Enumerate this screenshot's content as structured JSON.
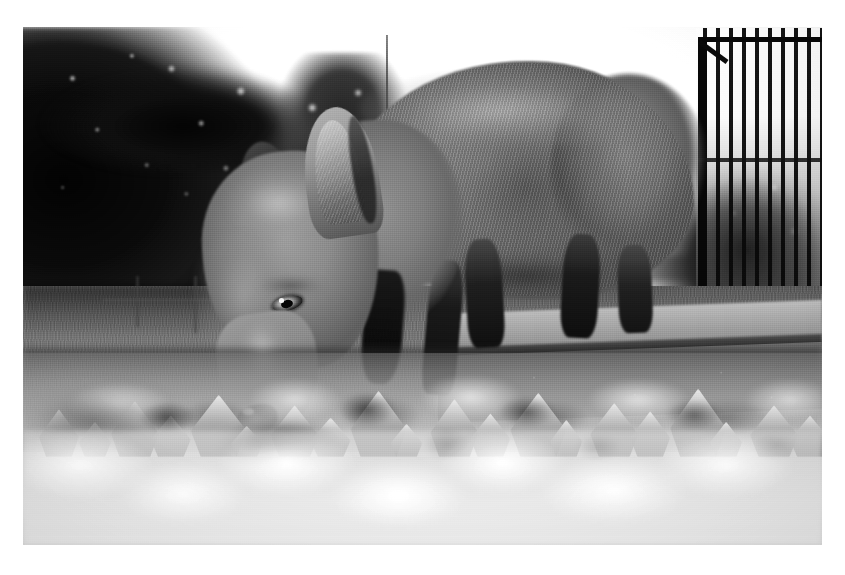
{
  "page": {
    "background_color": "#ffffff",
    "width": 845,
    "height": 575
  },
  "photo": {
    "alt": "Black and white photograph of a red fox foraging head-down among fallen leaves",
    "frame": {
      "x": 23,
      "y": 27,
      "width": 799,
      "height": 518
    },
    "color_mode": "grayscale",
    "palette": {
      "sky": "#fbfbfb",
      "tree_mass": "#101010",
      "grass": "#7d7d7d",
      "fox_fur": "#8a8a8a",
      "fox_legs": "#1a1a1a",
      "stone_kerb": "#6e6e6e",
      "leaf_litter_highlight": "#ffffff",
      "leaf_litter_shadow": "#4a4a4a",
      "railing": "#0d0d0d"
    },
    "subjects": [
      {
        "name": "fox",
        "label": "Red fox, head lowered, foraging"
      },
      {
        "name": "leaf-litter",
        "label": "Fallen leaves in foreground"
      },
      {
        "name": "grass-field",
        "label": "Mown grass verge"
      },
      {
        "name": "tree-canopy",
        "label": "Dark tree canopy, upper left"
      },
      {
        "name": "conifer",
        "label": "Backlit conifer, centre left"
      },
      {
        "name": "iron-railing",
        "label": "Iron railing / gate, upper right"
      },
      {
        "name": "stone-kerb",
        "label": "Stone kerb edge, right"
      },
      {
        "name": "antenna-pole",
        "label": "Thin aerial pole against sky"
      },
      {
        "name": "background-wall",
        "label": "Blurred wall and buildings"
      }
    ]
  }
}
